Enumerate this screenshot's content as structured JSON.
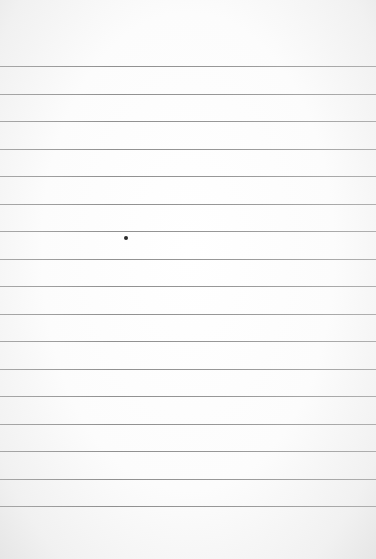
{
  "paper": {
    "kind": "ruled-notebook-page",
    "background_color": "#fdfdfd",
    "line_color": "#858585",
    "first_line_y": 66,
    "line_spacing": 27.5,
    "line_count": 17
  },
  "marks": [
    {
      "type": "ink-speck",
      "x": 124,
      "y": 236,
      "color": "#2a2a2a"
    }
  ]
}
